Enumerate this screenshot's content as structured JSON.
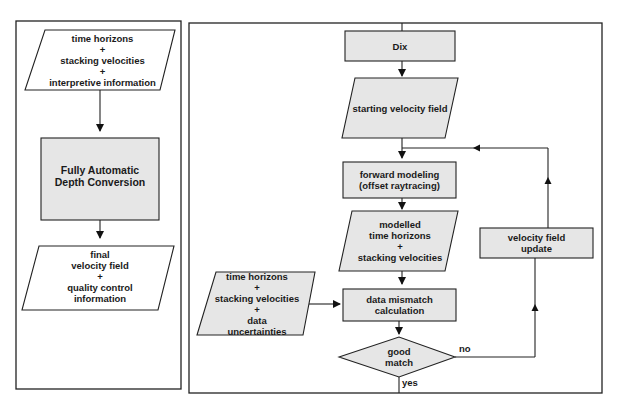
{
  "left_panel": {
    "input": [
      "time horizons",
      "+",
      "stacking velocities",
      "+",
      "interpretive information"
    ],
    "process": [
      "Fully Automatic",
      "Depth Conversion"
    ],
    "output": [
      "final",
      "velocity field",
      "+",
      "quality control",
      "information"
    ]
  },
  "right_panel": {
    "dix": "Dix",
    "starting": "starting velocity field",
    "forward": [
      "forward modeling",
      "(offset raytracing)"
    ],
    "modelled": [
      "modelled",
      "time horizons",
      "+",
      "stacking velocities"
    ],
    "observed": [
      "time horizons",
      "+",
      "stacking velocities",
      "+",
      "data",
      "uncertainties"
    ],
    "mismatch": [
      "data mismatch",
      "calculation"
    ],
    "decision": [
      "good",
      "match"
    ],
    "update": [
      "velocity field",
      "update"
    ],
    "yes_label": "yes",
    "no_label": "no"
  },
  "colors": {
    "fill": "#e6e6e6",
    "stroke": "#222222"
  }
}
